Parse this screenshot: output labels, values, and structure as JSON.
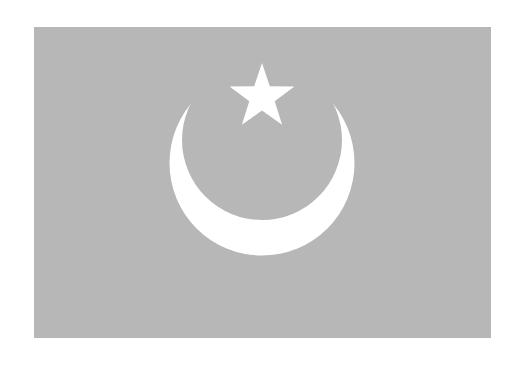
{
  "image": {
    "subject": "flag",
    "colors": {
      "field": "#b7b7b7",
      "emblem": "#ffffff",
      "background": "#ffffff"
    },
    "emblem": {
      "crescent": "crescent-icon",
      "star": "star-icon"
    }
  }
}
